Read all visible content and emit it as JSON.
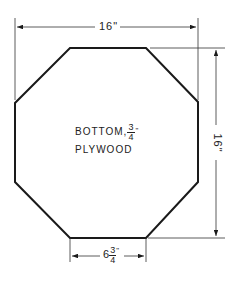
{
  "diagram": {
    "type": "technical-drawing",
    "shape": "octagon",
    "dimensions": {
      "width": "16\"",
      "height": "16\"",
      "edge": {
        "whole": "6",
        "num": "3",
        "den": "4",
        "unit": "\""
      }
    },
    "label": {
      "line1": "BOTTOM,",
      "thickness_num": "3",
      "thickness_den": "4",
      "unit": "\"",
      "line2": "PLYWOOD"
    },
    "colors": {
      "line": "#1a1a1a",
      "background": "#ffffff"
    }
  }
}
